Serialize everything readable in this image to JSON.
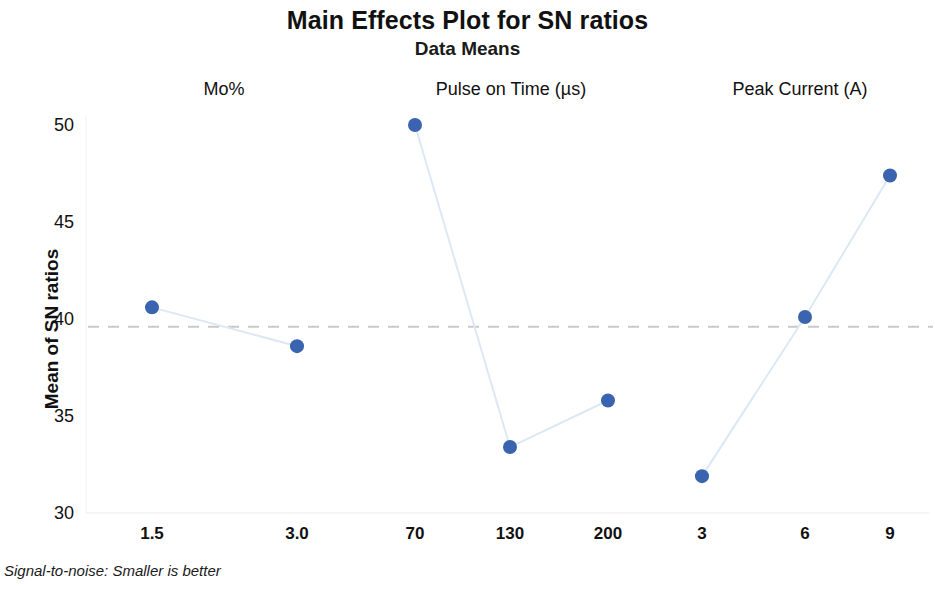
{
  "chart_data": {
    "type": "line",
    "title": "Main Effects Plot for SN ratios",
    "subtitle": "Data Means",
    "ylabel": "Mean of SN ratios",
    "xlabel": "",
    "ylim": [
      30,
      50
    ],
    "yticks": [
      30,
      35,
      40,
      45,
      50
    ],
    "grid": false,
    "legend": null,
    "footnote": "Signal-to-noise: Smaller is better",
    "reference_line": {
      "value": 39.6,
      "style": "dashed",
      "color": "#c9c9c9"
    },
    "marker_color": "#3a63b0",
    "line_color": "#dce8f5",
    "panels": [
      {
        "name": "Mo%",
        "categories": [
          "1.5",
          "3.0"
        ],
        "values": [
          40.6,
          38.6
        ]
      },
      {
        "name": "Pulse on Time (µs)",
        "categories": [
          "70",
          "130",
          "200"
        ],
        "values": [
          50.0,
          33.4,
          35.8
        ]
      },
      {
        "name": "Peak Current (A)",
        "categories": [
          "3",
          "6",
          "9"
        ],
        "values": [
          31.9,
          40.1,
          47.4
        ]
      }
    ]
  },
  "labels": {
    "title": "Main Effects Plot for SN ratios",
    "subtitle": "Data Means",
    "y_axis_title": "Mean of SN ratios",
    "footnote": "Signal-to-noise: Smaller is better",
    "panel_1": "Mo%",
    "panel_2": "Pulse on Time (µs)",
    "panel_3": "Peak Current (A)",
    "ytick_50": "50",
    "ytick_45": "45",
    "ytick_40": "40",
    "ytick_35": "35",
    "ytick_30": "30",
    "xtick_p1_c1": "1.5",
    "xtick_p1_c2": "3.0",
    "xtick_p2_c1": "70",
    "xtick_p2_c2": "130",
    "xtick_p2_c3": "200",
    "xtick_p3_c1": "3",
    "xtick_p3_c2": "6",
    "xtick_p3_c3": "9"
  }
}
